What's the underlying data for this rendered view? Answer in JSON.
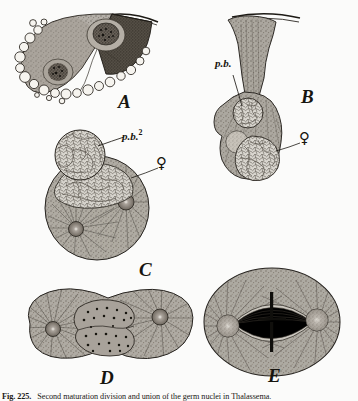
{
  "plate": {
    "background_color": "#fbfbfa",
    "ink_color": "#17150f",
    "caption_figure_number": "Fig. 225.",
    "caption_text": "Fig. 225.—Second maturation division and union of the germ nuclei in Thalassema."
  },
  "panels": [
    {
      "id": "A",
      "letter": "A",
      "description": "Egg with two dark chromatin masses and marginal vacuoles beneath the fertilization membrane"
    },
    {
      "id": "B",
      "letter": "B",
      "description": "Elongated egg drawn into a flared stalk with polar body and female pronucleus"
    },
    {
      "id": "C",
      "letter": "C",
      "description": "Rounded egg with reticulate second polar body and two asters"
    },
    {
      "id": "D",
      "letter": "D",
      "description": "Dumb-bell shaped cell with two polar asters and double chromatin lobes"
    },
    {
      "id": "E",
      "letter": "E",
      "description": "Oval cell with mitotic spindle, two asters and central chromosome bar"
    }
  ],
  "annotations": [
    {
      "id": "pb-b",
      "panel": "B",
      "text": "p.b.",
      "superscript": "",
      "name": "polar-body-label"
    },
    {
      "id": "pb2-c",
      "panel": "C",
      "text": "p.b.",
      "superscript": "2",
      "name": "second-polar-body-label"
    },
    {
      "id": "female-b",
      "panel": "B",
      "text": "♀",
      "name": "female-pronucleus-symbol"
    },
    {
      "id": "female-c",
      "panel": "C",
      "text": "♀",
      "name": "female-pronucleus-symbol"
    }
  ]
}
